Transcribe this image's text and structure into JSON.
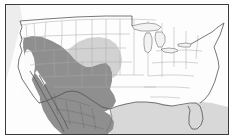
{
  "figure": {
    "kind": "species-distribution-map",
    "title": "",
    "caption": "",
    "region_name": "North America — United States and Mexico",
    "projection_note": ""
  },
  "frame": {
    "border_color": "#3b3b3b",
    "border_width_px": 1,
    "background_color": "#fdfdfd",
    "margin_left_px": 5,
    "margin_top_px": 4,
    "inner_width_px": 224,
    "inner_height_px": 131
  },
  "colors": {
    "land_unshaded": "#fdfdfd",
    "range_primary": "#8f8f8f",
    "range_secondary": "#d2d2d2",
    "ocean_gulf": "#d8d8d8",
    "state_border": "#a8a8a8",
    "country_border": "#6a6a6a",
    "coastline": "#555555",
    "lake_fill": "#f2f2f2",
    "lake_outline": "#6f6f6f"
  },
  "legend": {
    "visible": false,
    "entries": [
      {
        "label": "",
        "swatch": "#8f8f8f"
      },
      {
        "label": "",
        "swatch": "#d2d2d2"
      }
    ]
  },
  "map_content": {
    "shaded_primary_description": "Dark gray distribution range covering the American Southwest (California interior, Nevada, Utah, Arizona, New Mexico, Colorado, western Kansas, Oklahoma, Texas) and most of northern and central Mexico including the Baja California peninsula",
    "shaded_secondary_description": "Light gray secondary range over the central Great Plains (Nebraska, Kansas, eastern Colorado)",
    "unshaded_description": "Eastern and northern United States shown white, outside the range",
    "white_gap_description": "Unshaded white corridor along the California Central Valley and lower Colorado River",
    "water_bodies": [
      "Great Lakes",
      "Gulf of Mexico",
      "Pacific Ocean",
      "Atlantic Ocean"
    ]
  },
  "labels": {
    "visible_text": []
  }
}
